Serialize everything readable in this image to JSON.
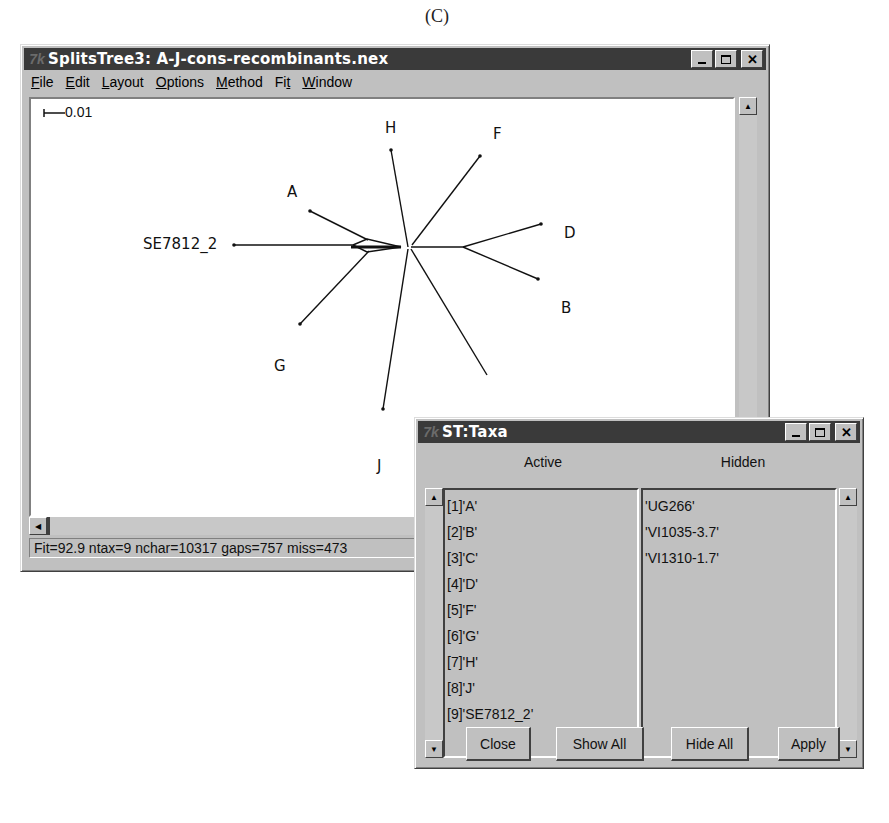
{
  "figure_label": "(C)",
  "main_window": {
    "title": "SplitsTree3: A-J-cons-recombinants.nex",
    "icon": "splitstree-app-icon",
    "title_buttons": [
      "minimize",
      "maximize",
      "close"
    ],
    "menu": [
      {
        "label": "File",
        "mnemonic": "F"
      },
      {
        "label": "Edit",
        "mnemonic": "E"
      },
      {
        "label": "Layout",
        "mnemonic": "L"
      },
      {
        "label": "Options",
        "mnemonic": "O"
      },
      {
        "label": "Method",
        "mnemonic": "M"
      },
      {
        "label": "Fit",
        "mnemonic": "t"
      },
      {
        "label": "Window",
        "mnemonic": "W"
      }
    ],
    "scale_bar_label": "0.01",
    "taxa_labels": {
      "H": "H",
      "F": "F",
      "A": "A",
      "D": "D",
      "SE7812_2": "SE7812_2",
      "B": "B",
      "G": "G",
      "J": "J"
    },
    "status": "Fit=92.9 ntax=9 nchar=10317 gaps=757 miss=473"
  },
  "taxa_dialog": {
    "title": "ST:Taxa",
    "icon": "splitstree-app-icon",
    "active_header": "Active",
    "hidden_header": "Hidden",
    "active": [
      "[1]'A'",
      "[2]'B'",
      "[3]'C'",
      "[4]'D'",
      "[5]'F'",
      "[6]'G'",
      "[7]'H'",
      "[8]'J'",
      "[9]'SE7812_2'"
    ],
    "hidden": [
      "'UG266'",
      "'VI1035-3.7'",
      "'VI1310-1.7'"
    ],
    "buttons": {
      "close": "Close",
      "show_all": "Show All",
      "hide_all": "Hide All",
      "apply": "Apply"
    }
  }
}
